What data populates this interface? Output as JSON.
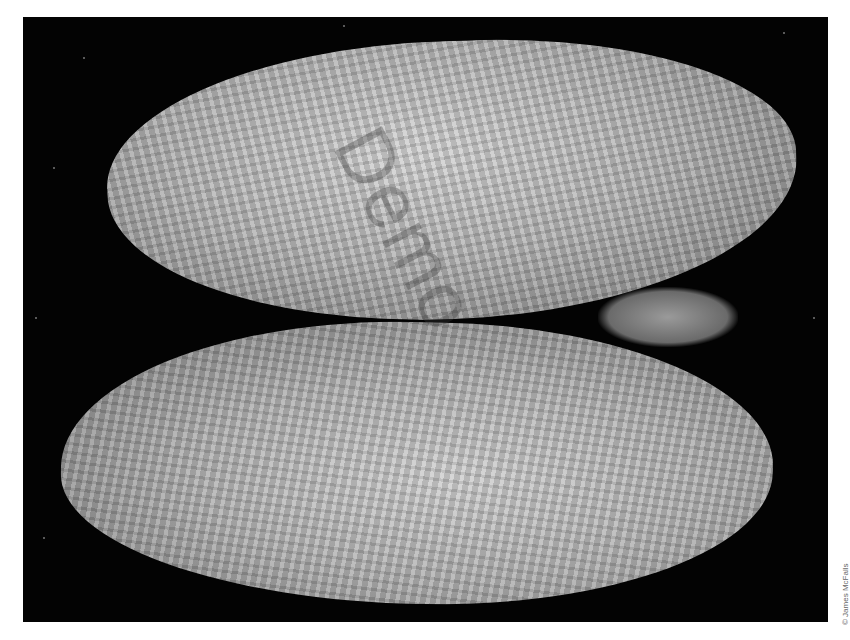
{
  "image": {
    "subject": "Two valves of an angel wing shell photographed on black background",
    "background_color": "#030303",
    "frame_color": "#ffffff",
    "shell_color": "#b4b4b4"
  },
  "watermark": {
    "text": "Demo"
  },
  "credit": {
    "text": "© James McFalls"
  }
}
